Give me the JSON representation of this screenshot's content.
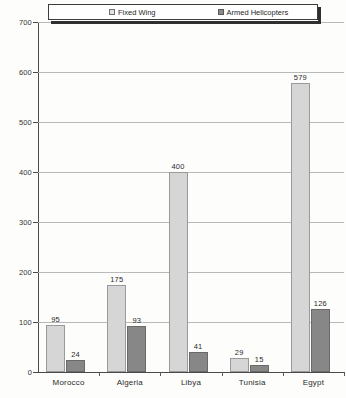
{
  "chart_data": {
    "type": "bar",
    "title": "",
    "xlabel": "",
    "ylabel": "",
    "ylim": [
      0,
      700
    ],
    "yticks": [
      0,
      100,
      200,
      300,
      400,
      500,
      600,
      700
    ],
    "grid": true,
    "legend_position": "top",
    "categories": [
      "Morocco",
      "Algeria",
      "Libya",
      "Tunisia",
      "Egypt"
    ],
    "series": [
      {
        "name": "Fixed Wing",
        "color": "#d6d6d6",
        "values": [
          95,
          175,
          400,
          29,
          579
        ]
      },
      {
        "name": "Armed Helicopters",
        "color": "#878787",
        "values": [
          24,
          93,
          41,
          15,
          126
        ]
      }
    ]
  },
  "legend": {
    "items": [
      {
        "label": "Fixed Wing",
        "swatch": "light-gray-swatch"
      },
      {
        "label": "Armed Helicopters",
        "swatch": "dark-gray-swatch"
      }
    ]
  },
  "axis": {
    "y_tick_labels": [
      "700",
      "600",
      "500",
      "400",
      "300",
      "200",
      "100",
      "0"
    ]
  },
  "value_labels": {
    "Morocco": {
      "fixed_wing": "95",
      "armed_helicopters": "24"
    },
    "Algeria": {
      "fixed_wing": "175",
      "armed_helicopters": "93"
    },
    "Libya": {
      "fixed_wing": "400",
      "armed_helicopters": "41"
    },
    "Tunisia": {
      "fixed_wing": "29",
      "armed_helicopters": "15"
    },
    "Egypt": {
      "fixed_wing": "579",
      "armed_helicopters": "126"
    }
  }
}
